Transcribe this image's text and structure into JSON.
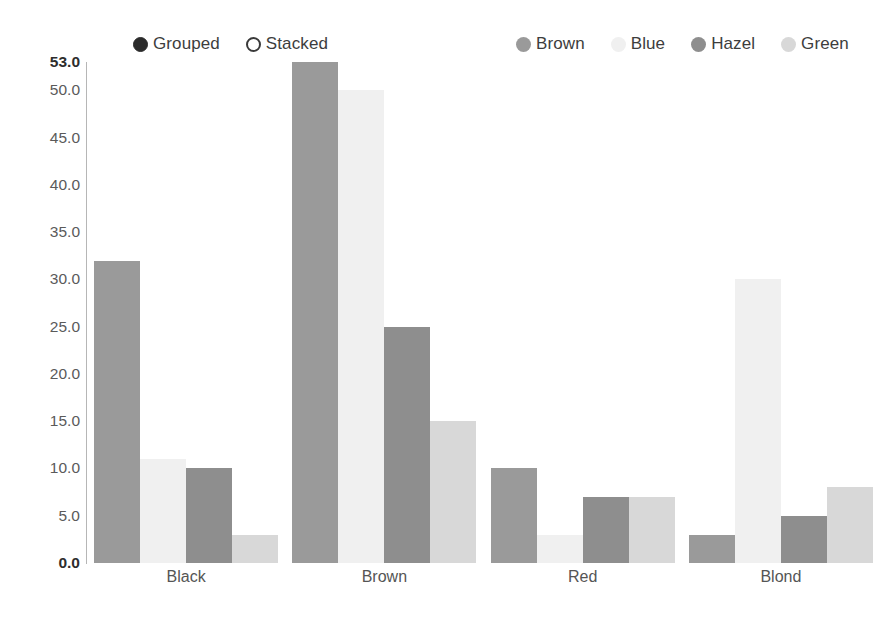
{
  "legend": {
    "mode": {
      "name": "layout-mode",
      "options": [
        {
          "label": "Grouped",
          "selected": true
        },
        {
          "label": "Stacked",
          "selected": false
        }
      ]
    },
    "series": [
      {
        "label": "Brown",
        "color": "#9a9a9a"
      },
      {
        "label": "Blue",
        "color": "#f0f0f0"
      },
      {
        "label": "Hazel",
        "color": "#8e8e8e"
      },
      {
        "label": "Green",
        "color": "#d8d8d8"
      }
    ]
  },
  "chart_data": {
    "type": "bar",
    "title": "",
    "xlabel": "",
    "ylabel": "",
    "grid": false,
    "legend_position": "top",
    "orientation": "grouped",
    "categories": [
      "Black",
      "Brown",
      "Red",
      "Blond"
    ],
    "ylim": [
      0,
      53
    ],
    "yticks": [
      "0.0",
      "5.0",
      "10.0",
      "15.0",
      "20.0",
      "25.0",
      "30.0",
      "35.0",
      "40.0",
      "45.0",
      "50.0",
      "53.0"
    ],
    "ytick_values": [
      0,
      5,
      10,
      15,
      20,
      25,
      30,
      35,
      40,
      45,
      50,
      53
    ],
    "series": [
      {
        "name": "Brown",
        "color": "#9a9a9a",
        "values": [
          32,
          53,
          10,
          3
        ]
      },
      {
        "name": "Blue",
        "color": "#f0f0f0",
        "values": [
          11,
          50,
          3,
          30
        ]
      },
      {
        "name": "Hazel",
        "color": "#8e8e8e",
        "values": [
          10,
          25,
          7,
          5
        ]
      },
      {
        "name": "Green",
        "color": "#d8d8d8",
        "values": [
          3,
          15,
          7,
          8
        ]
      }
    ]
  }
}
